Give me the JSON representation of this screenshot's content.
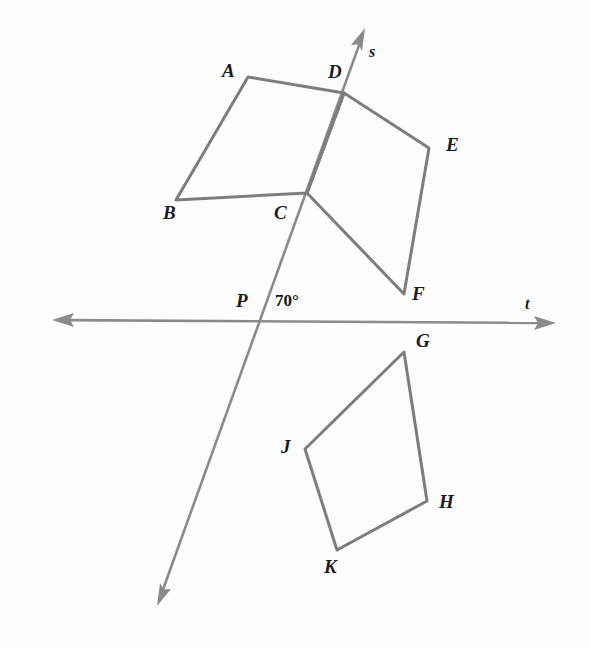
{
  "figure": {
    "background_color": "#fdfdfd",
    "stroke_color": "#7d7d7d",
    "label_color": "#1a1a1a",
    "width": 590,
    "height": 648
  },
  "angle": {
    "value": "70°",
    "x": 275,
    "y": 292
  },
  "lines": [
    {
      "name": "s",
      "label": "s",
      "label_x": 369,
      "label_y": 44,
      "from": {
        "x": 365,
        "y": 28
      },
      "to": {
        "x": 157,
        "y": 606
      },
      "arrows": "both"
    },
    {
      "name": "t",
      "label": "t",
      "label_x": 525,
      "label_y": 296,
      "from": {
        "x": 52,
        "y": 320
      },
      "to": {
        "x": 556,
        "y": 323
      },
      "arrows": "both"
    }
  ],
  "intersection": {
    "label": "P",
    "label_x": 236,
    "label_y": 291,
    "x": 258,
    "y": 317
  },
  "quadrilaterals": [
    {
      "name": "ABCD",
      "vertices": [
        {
          "label": "A",
          "x": 248,
          "y": 77,
          "label_x": 222,
          "label_y": 61
        },
        {
          "label": "B",
          "x": 176,
          "y": 200,
          "label_x": 163,
          "label_y": 203
        },
        {
          "label": "C",
          "x": 307,
          "y": 193,
          "label_x": 274,
          "label_y": 203
        },
        {
          "label": "D",
          "x": 344,
          "y": 93,
          "label_x": 328,
          "label_y": 62
        }
      ]
    },
    {
      "name": "CDEF",
      "vertices": [
        {
          "label": "C",
          "x": 307,
          "y": 193,
          "label_x": 274,
          "label_y": 203
        },
        {
          "label": "D",
          "x": 344,
          "y": 93,
          "label_x": 328,
          "label_y": 62
        },
        {
          "label": "E",
          "x": 429,
          "y": 148,
          "label_x": 446,
          "label_y": 135
        },
        {
          "label": "F",
          "x": 404,
          "y": 294,
          "label_x": 412,
          "label_y": 284
        }
      ]
    },
    {
      "name": "GHKJ",
      "vertices": [
        {
          "label": "G",
          "x": 404,
          "y": 352,
          "label_x": 416,
          "label_y": 331
        },
        {
          "label": "H",
          "x": 427,
          "y": 501,
          "label_x": 439,
          "label_y": 492
        },
        {
          "label": "K",
          "x": 337,
          "y": 550,
          "label_x": 324,
          "label_y": 557
        },
        {
          "label": "J",
          "x": 305,
          "y": 449,
          "label_x": 281,
          "label_y": 437
        }
      ]
    }
  ]
}
